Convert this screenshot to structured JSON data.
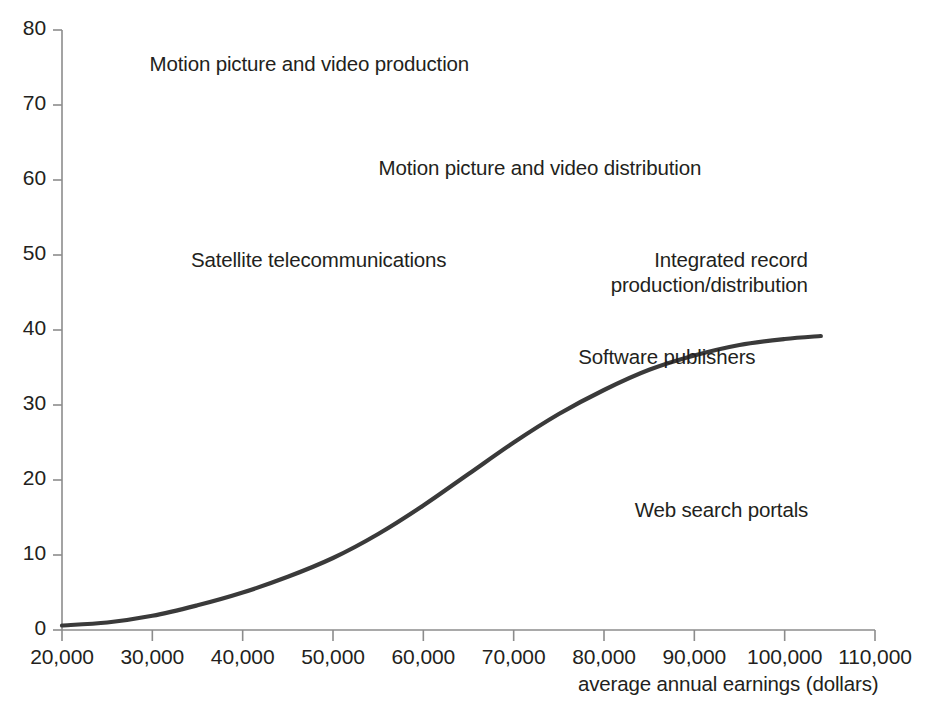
{
  "chart_data": {
    "type": "scatter",
    "title": "",
    "xlabel": "average annual earnings  (dollars)",
    "ylabel": "",
    "xlim": [
      20000,
      110000
    ],
    "ylim": [
      0,
      80
    ],
    "grid": false,
    "legend": "none",
    "x_ticks": [
      "20,000",
      "30,000",
      "40,000",
      "50,000",
      "60,000",
      "70,000",
      "80,000",
      "90,000",
      "100,000",
      "110,000"
    ],
    "x_tick_values": [
      20000,
      30000,
      40000,
      50000,
      60000,
      70000,
      80000,
      90000,
      100000,
      110000
    ],
    "y_ticks": [
      "0",
      "10",
      "20",
      "30",
      "40",
      "50",
      "60",
      "70",
      "80"
    ],
    "y_tick_values": [
      0,
      10,
      20,
      30,
      40,
      50,
      60,
      70,
      80
    ],
    "marker": "diamond",
    "marker_color": "#1a1a1a",
    "trend_line_color": "#3a3a3a",
    "annotations": [
      {
        "label": "Motion picture and video production",
        "x": 66500,
        "y": 75.5,
        "label_side": "left"
      },
      {
        "label": "Motion picture and video distribution",
        "x": 53600,
        "y": 61.6,
        "label_side": "right"
      },
      {
        "label": "Satellite telecommunications",
        "x": 64000,
        "y": 49.3,
        "label_side": "left"
      },
      {
        "label": "Integrated record production/distribution",
        "x": 104000,
        "y": 46.0,
        "label_side": "left-2line"
      },
      {
        "label": "Software publishers",
        "x": 98200,
        "y": 36.4,
        "label_side": "left"
      },
      {
        "label": "Web search portals",
        "x": 93000,
        "y": 12.4,
        "label_side": "above"
      }
    ],
    "points": [
      [
        20400,
        0.2
      ],
      [
        21100,
        0.3
      ],
      [
        21900,
        0.2
      ],
      [
        22600,
        0.4
      ],
      [
        23100,
        0.3
      ],
      [
        23600,
        0.5
      ],
      [
        24000,
        0.3
      ],
      [
        24400,
        0.6
      ],
      [
        24800,
        0.4
      ],
      [
        25100,
        0.8
      ],
      [
        25500,
        0.5
      ],
      [
        25800,
        1.0
      ],
      [
        26100,
        0.4
      ],
      [
        26400,
        0.7
      ],
      [
        26700,
        1.2
      ],
      [
        27000,
        0.5
      ],
      [
        27200,
        1.6
      ],
      [
        27400,
        0.9
      ],
      [
        27600,
        4.1
      ],
      [
        27800,
        0.6
      ],
      [
        28000,
        1.3
      ],
      [
        28200,
        2.9
      ],
      [
        28400,
        0.8
      ],
      [
        28600,
        1.9
      ],
      [
        28800,
        0.5
      ],
      [
        29000,
        7.2
      ],
      [
        29200,
        1.1
      ],
      [
        29400,
        0.7
      ],
      [
        29600,
        2.2
      ],
      [
        29800,
        1.4
      ],
      [
        30000,
        0.6
      ],
      [
        30200,
        3.3
      ],
      [
        30400,
        1.0
      ],
      [
        30600,
        0.8
      ],
      [
        30900,
        5.9
      ],
      [
        31100,
        1.5
      ],
      [
        31300,
        0.7
      ],
      [
        31600,
        2.1
      ],
      [
        31900,
        1.1
      ],
      [
        32200,
        0.5
      ],
      [
        32500,
        6.0
      ],
      [
        32800,
        1.8
      ],
      [
        33000,
        0.9
      ],
      [
        33300,
        1.3
      ],
      [
        33600,
        0.6
      ],
      [
        33900,
        2.6
      ],
      [
        34200,
        1.1
      ],
      [
        34500,
        0.4
      ],
      [
        34800,
        3.1
      ],
      [
        35100,
        1.7
      ],
      [
        35400,
        0.8
      ],
      [
        35700,
        1.2
      ],
      [
        36000,
        0.3
      ],
      [
        36300,
        2.0
      ],
      [
        36600,
        0.9
      ],
      [
        36900,
        1.5
      ],
      [
        37200,
        0.5
      ],
      [
        37600,
        1.1
      ],
      [
        38000,
        0.7
      ],
      [
        38400,
        0.3
      ],
      [
        38800,
        1.0
      ],
      [
        39200,
        0.6
      ],
      [
        39600,
        0.4
      ],
      [
        40000,
        8.0
      ],
      [
        40200,
        7.5
      ],
      [
        40600,
        3.4
      ],
      [
        41000,
        18.8
      ],
      [
        41400,
        1.1
      ],
      [
        41800,
        0.7
      ],
      [
        42200,
        2.5
      ],
      [
        42600,
        1.4
      ],
      [
        43000,
        4.0
      ],
      [
        43400,
        0.8
      ],
      [
        43800,
        2.9
      ],
      [
        44200,
        1.2
      ],
      [
        44600,
        0.5
      ],
      [
        45000,
        3.6
      ],
      [
        45400,
        1.8
      ],
      [
        45800,
        0.9
      ],
      [
        46200,
        2.2
      ],
      [
        46600,
        5.0
      ],
      [
        46900,
        7.8
      ],
      [
        47200,
        0.8
      ],
      [
        47500,
        1.5
      ],
      [
        47800,
        0.4
      ],
      [
        48100,
        2.8
      ],
      [
        48400,
        1.0
      ],
      [
        48700,
        0.6
      ],
      [
        49000,
        20.0
      ],
      [
        49400,
        5.6
      ],
      [
        49800,
        0.5
      ],
      [
        50200,
        3.0
      ],
      [
        50600,
        1.2
      ],
      [
        51000,
        6.5
      ],
      [
        51400,
        15.2
      ],
      [
        51800,
        2.1
      ],
      [
        52200,
        0.9
      ],
      [
        52600,
        8.0
      ],
      [
        53000,
        4.4
      ],
      [
        53400,
        1.6
      ],
      [
        53800,
        0.7
      ],
      [
        54200,
        5.1
      ],
      [
        54600,
        2.3
      ],
      [
        55000,
        5.2
      ],
      [
        55400,
        5.0
      ],
      [
        55800,
        1.1
      ],
      [
        56200,
        0.6
      ],
      [
        56600,
        4.0
      ],
      [
        57000,
        2.0
      ],
      [
        57400,
        1.4
      ],
      [
        57800,
        16.5
      ],
      [
        58200,
        8.6
      ],
      [
        58600,
        0.8
      ],
      [
        59000,
        2.7
      ],
      [
        59400,
        0.5
      ],
      [
        59800,
        1.9
      ],
      [
        60200,
        3.1
      ],
      [
        60600,
        2.4
      ],
      [
        61000,
        1.0
      ],
      [
        61400,
        0.6
      ],
      [
        62000,
        0.4
      ],
      [
        62600,
        3.5
      ],
      [
        63200,
        2.6
      ],
      [
        64600,
        3.5
      ],
      [
        65000,
        0.5
      ],
      [
        67200,
        8.5
      ],
      [
        70600,
        7.6
      ],
      [
        72100,
        10.5
      ]
    ],
    "trend_curve": [
      [
        20000,
        0.6
      ],
      [
        25000,
        1.0
      ],
      [
        30000,
        1.9
      ],
      [
        35000,
        3.3
      ],
      [
        40000,
        5.0
      ],
      [
        45000,
        7.1
      ],
      [
        50000,
        9.6
      ],
      [
        55000,
        12.8
      ],
      [
        60000,
        16.6
      ],
      [
        65000,
        20.8
      ],
      [
        70000,
        25.0
      ],
      [
        75000,
        28.8
      ],
      [
        80000,
        32.0
      ],
      [
        85000,
        34.7
      ],
      [
        90000,
        36.6
      ],
      [
        95000,
        38.0
      ],
      [
        100000,
        38.8
      ],
      [
        104000,
        39.2
      ]
    ]
  }
}
